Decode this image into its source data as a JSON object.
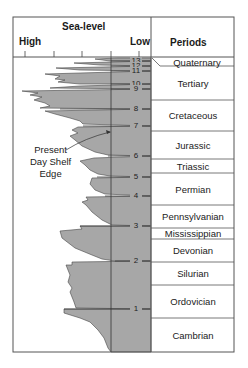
{
  "header": {
    "title": "Sea-level",
    "high_label": "High",
    "low_label": "Low",
    "periods_label": "Periods"
  },
  "callout": {
    "line1": "Present",
    "line2": "Day Shelf",
    "line3": "Edge"
  },
  "colors": {
    "fill": "#a7a7a7",
    "line": "#333333",
    "frame": "#555555",
    "background": "#ffffff"
  },
  "sequence_markers": [
    {
      "label": "13",
      "y": 61
    },
    {
      "label": "12",
      "y": 66
    },
    {
      "label": "11",
      "y": 71
    },
    {
      "label": "10",
      "y": 84
    },
    {
      "label": "9",
      "y": 89
    },
    {
      "label": "8",
      "y": 109
    },
    {
      "label": "7",
      "y": 126
    },
    {
      "label": "6",
      "y": 156
    },
    {
      "label": "5",
      "y": 177
    },
    {
      "label": "4",
      "y": 196
    },
    {
      "label": "3",
      "y": 226
    },
    {
      "label": "2",
      "y": 261
    },
    {
      "label": "1",
      "y": 309
    }
  ],
  "periods": [
    {
      "name": "Quaternary",
      "top": 57,
      "bottom": 67
    },
    {
      "name": "Tertiary",
      "top": 67,
      "bottom": 100
    },
    {
      "name": "Cretaceous",
      "top": 100,
      "bottom": 131
    },
    {
      "name": "Jurassic",
      "top": 131,
      "bottom": 159
    },
    {
      "name": "Triassic",
      "top": 159,
      "bottom": 173
    },
    {
      "name": "Permian",
      "top": 173,
      "bottom": 205
    },
    {
      "name": "Pennsylvanian",
      "top": 205,
      "bottom": 228
    },
    {
      "name": "Mississippian",
      "top": 228,
      "bottom": 239
    },
    {
      "name": "Devonian",
      "top": 239,
      "bottom": 262
    },
    {
      "name": "Silurian",
      "top": 262,
      "bottom": 285
    },
    {
      "name": "Ordovician",
      "top": 285,
      "bottom": 318
    },
    {
      "name": "Cambrian",
      "top": 318,
      "bottom": 352
    }
  ]
}
